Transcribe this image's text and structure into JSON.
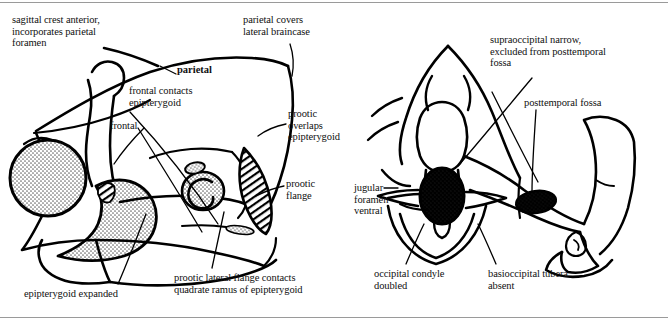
{
  "figure": {
    "background_color": "#ffffff",
    "ink_color": "#000000",
    "rule_color": "#9a9a9a",
    "stipple_color": "#808080"
  },
  "panels": [
    {
      "id": "left",
      "view": "lateral-skull-view",
      "labels": [
        {
          "name": "sagittal-crest-label",
          "text": "sagittal crest anterior,\nincorporates parietal\nforamen",
          "x": 12,
          "y": 14,
          "bold": false,
          "align": "left"
        },
        {
          "name": "parietal-covers-label",
          "text": "parietal covers\nlateral braincase",
          "x": 243,
          "y": 14,
          "bold": false,
          "align": "left"
        },
        {
          "name": "parietal-label",
          "text": "parietal",
          "x": 177,
          "y": 64,
          "bold": true,
          "align": "left"
        },
        {
          "name": "frontal-contacts-label",
          "text": "frontal contacts\nepipterygoid",
          "x": 129,
          "y": 85,
          "bold": false,
          "align": "left"
        },
        {
          "name": "frontal-label",
          "text": "frontal",
          "x": 110,
          "y": 120,
          "bold": false,
          "align": "left"
        },
        {
          "name": "prootic-overlaps-label",
          "text": "prootic\noverlaps\nepipterygoid",
          "x": 288,
          "y": 108,
          "bold": false,
          "align": "left"
        },
        {
          "name": "prootic-flange-label",
          "text": "prootic\nflange",
          "x": 286,
          "y": 178,
          "bold": false,
          "align": "left"
        },
        {
          "name": "epipterygoid-expanded-label",
          "text": "epipterygoid expanded",
          "x": 24,
          "y": 288,
          "bold": false,
          "align": "left"
        },
        {
          "name": "prootic-lateral-flange-label",
          "text": "prootic lateral flange contacts\nquadrate ramus of epipterygoid",
          "x": 174,
          "y": 272,
          "bold": false,
          "align": "left"
        }
      ]
    },
    {
      "id": "right",
      "view": "posterior-skull-view",
      "labels": [
        {
          "name": "supraoccipital-narrow-label",
          "text": "supraoccipital narrow,\nexcluded from posttemporal\nfossa",
          "x": 490,
          "y": 34,
          "bold": false,
          "align": "left"
        },
        {
          "name": "posttemporal-fossa-label",
          "text": "posttemporal fossa",
          "x": 524,
          "y": 97,
          "bold": false,
          "align": "left"
        },
        {
          "name": "jugular-foramen-ventral-label",
          "text": "jugular\nforamen\nventral",
          "x": 354,
          "y": 182,
          "bold": false,
          "align": "left"
        },
        {
          "name": "occipital-condyle-doubled-label",
          "text": "occipital condyle\ndoubled",
          "x": 374,
          "y": 268,
          "bold": false,
          "align": "left"
        },
        {
          "name": "basioccipital-tubera-absent-label",
          "text": "basioccipital tubera\nabsent",
          "x": 488,
          "y": 268,
          "bold": false,
          "align": "left"
        }
      ]
    }
  ]
}
